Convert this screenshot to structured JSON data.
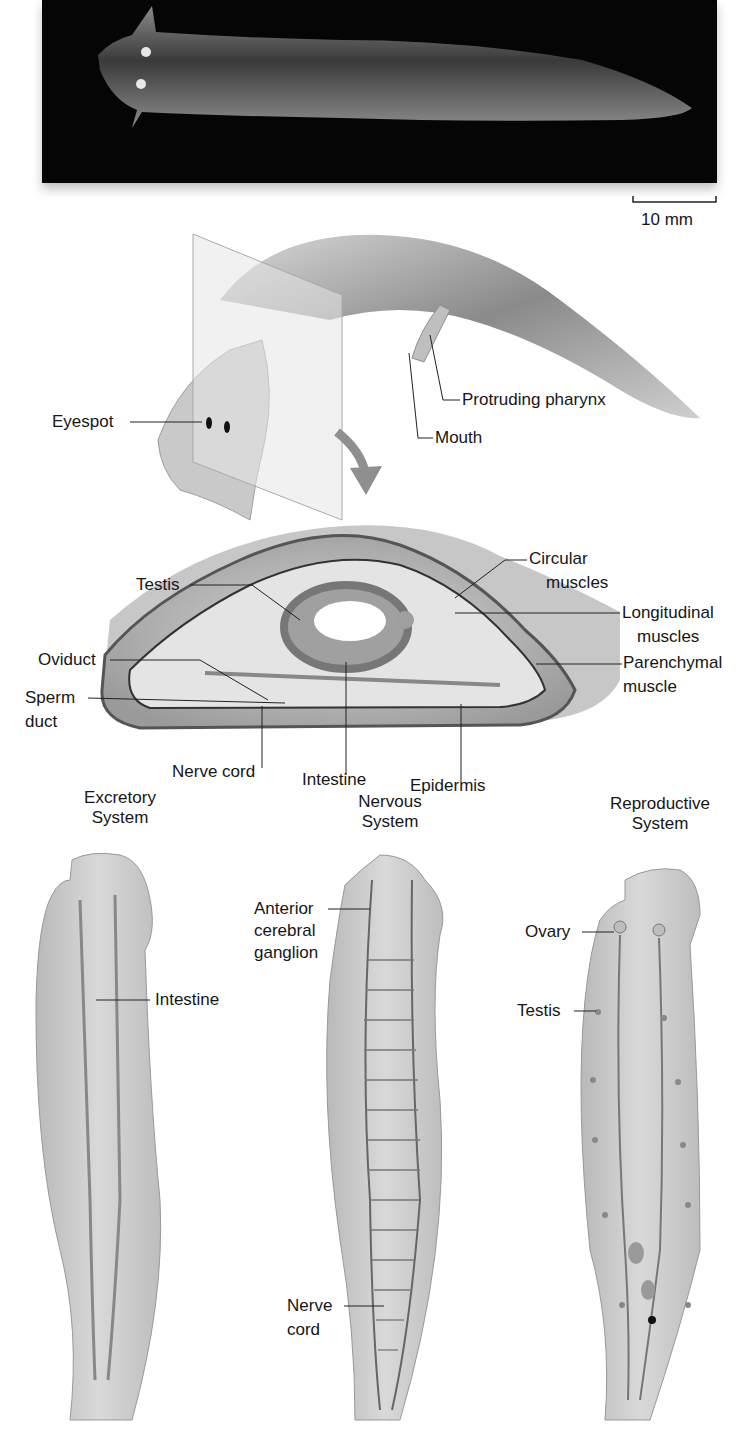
{
  "figure": {
    "photo": {
      "scale_bar_label": "10 mm"
    },
    "external_view": {
      "labels": {
        "eyespot": "Eyespot",
        "protruding_pharynx": "Protruding pharynx",
        "mouth": "Mouth"
      }
    },
    "cross_section": {
      "labels": {
        "testis": "Testis",
        "oviduct": "Oviduct",
        "sperm_duct_line1": "Sperm",
        "sperm_duct_line2": "duct",
        "nerve_cord": "Nerve cord",
        "intestine": "Intestine",
        "epidermis": "Epidermis",
        "circular_muscles_line1": "Circular",
        "circular_muscles_line2": "muscles",
        "longitudinal_muscles_line1": "Longitudinal",
        "longitudinal_muscles_line2": "muscles",
        "parenchymal_muscle_line1": "Parenchymal",
        "parenchymal_muscle_line2": "muscle"
      }
    },
    "systems": [
      {
        "title_line1": "Excretory",
        "title_line2": "System",
        "labels": {
          "intestine": "Intestine"
        }
      },
      {
        "title_line1": "Nervous",
        "title_line2": "System",
        "labels": {
          "ganglion_line1": "Anterior",
          "ganglion_line2": "cerebral",
          "ganglion_line3": "ganglion",
          "nerve_cord_line1": "Nerve",
          "nerve_cord_line2": "cord"
        }
      },
      {
        "title_line1": "Reproductive",
        "title_line2": "System",
        "labels": {
          "ovary": "Ovary",
          "testis": "Testis"
        }
      }
    ]
  }
}
